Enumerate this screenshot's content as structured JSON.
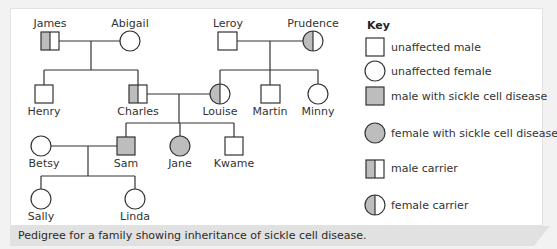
{
  "figure": {
    "caption": "Pedigree for a family showing inheritance of sickle cell disease.",
    "colors": {
      "affected": "#bdbdbd",
      "line": "#333333",
      "panel": "#ffffff",
      "caption_band": "#e1e1e1"
    }
  },
  "pedigree": {
    "generation1": [
      {
        "name": "James",
        "sex": "male",
        "status": "carrier"
      },
      {
        "name": "Abigail",
        "sex": "female",
        "status": "unaffected"
      },
      {
        "name": "Leroy",
        "sex": "male",
        "status": "unaffected"
      },
      {
        "name": "Prudence",
        "sex": "female",
        "status": "carrier"
      }
    ],
    "generation2": [
      {
        "name": "Henry",
        "sex": "male",
        "status": "unaffected"
      },
      {
        "name": "Charles",
        "sex": "male",
        "status": "carrier"
      },
      {
        "name": "Louise",
        "sex": "female",
        "status": "carrier"
      },
      {
        "name": "Martin",
        "sex": "male",
        "status": "unaffected"
      },
      {
        "name": "Minny",
        "sex": "female",
        "status": "unaffected"
      }
    ],
    "generation3": [
      {
        "name": "Betsy",
        "sex": "female",
        "status": "unaffected"
      },
      {
        "name": "Sam",
        "sex": "male",
        "status": "affected"
      },
      {
        "name": "Jane",
        "sex": "female",
        "status": "affected"
      },
      {
        "name": "Kwame",
        "sex": "male",
        "status": "unaffected"
      }
    ],
    "generation4": [
      {
        "name": "Sally",
        "sex": "female",
        "status": "unaffected"
      },
      {
        "name": "Linda",
        "sex": "female",
        "status": "unaffected"
      }
    ]
  },
  "key": {
    "title": "Key",
    "items": [
      {
        "symbol": "square-empty",
        "label": "unaffected male"
      },
      {
        "symbol": "circle-empty",
        "label": "unaffected female"
      },
      {
        "symbol": "square-filled",
        "label": "male with sickle cell disease"
      },
      {
        "symbol": "circle-filled",
        "label": "female with sickle cell disease"
      },
      {
        "symbol": "square-half",
        "label": "male carrier"
      },
      {
        "symbol": "circle-half",
        "label": "female carrier"
      }
    ]
  }
}
